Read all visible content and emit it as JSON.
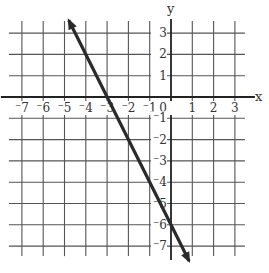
{
  "chart_data": {
    "type": "line",
    "title": "",
    "xlabel": "x",
    "ylabel": "y",
    "xlim": [
      -7.5,
      3.5
    ],
    "ylim": [
      -7.5,
      3.5
    ],
    "grid": true,
    "x_ticks": [
      -7,
      -6,
      -5,
      -4,
      -3,
      -2,
      -1,
      0,
      1,
      2,
      3
    ],
    "y_ticks": [
      -7,
      -6,
      -5,
      -4,
      -3,
      -2,
      -1,
      1,
      2,
      3
    ],
    "x_tick_labels": [
      "⁻7",
      "⁻6",
      "⁻5",
      "⁻4",
      "⁻3",
      "⁻2",
      "⁻1",
      "0",
      "1",
      "2",
      "3"
    ],
    "y_tick_labels": [
      "⁻7",
      "⁻6",
      "⁻5",
      "⁻4",
      "⁻3",
      "⁻2",
      "⁻1",
      "1",
      "2",
      "3"
    ],
    "series": [
      {
        "name": "line",
        "equation": "y = -2x - 6",
        "x": [
          -4.8,
          -3,
          0,
          0.85
        ],
        "y": [
          3.6,
          0,
          -6,
          -7.7
        ],
        "arrows": "both",
        "color": "#2a2a2a"
      }
    ],
    "intercepts": {
      "x_intercept": -3,
      "y_intercept": -6
    }
  },
  "labels": {
    "x_axis": "x",
    "y_axis": "y",
    "origin": "0"
  }
}
